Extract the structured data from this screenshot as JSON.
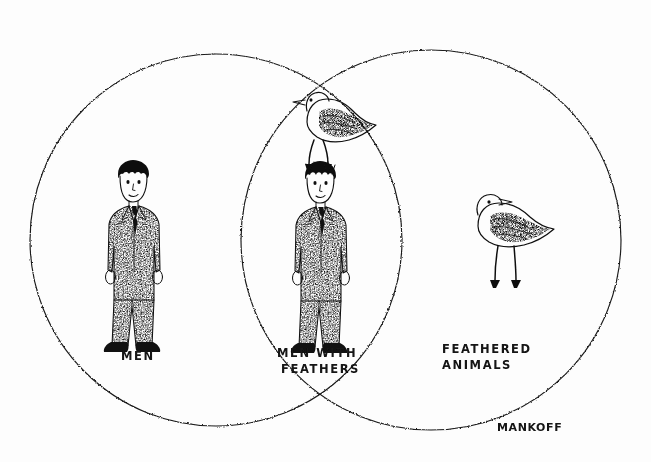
{
  "artwork": {
    "medium": "pen-and-ink cartoon",
    "type": "venn-diagram",
    "background_color": "#fdfdfd",
    "ink_color": "#111111",
    "width": 651,
    "height": 462
  },
  "diagram": {
    "kind": "two-set Venn diagram",
    "sets": [
      {
        "id": "men",
        "label": "MEN",
        "label_lines": [
          "MEN"
        ],
        "label_x": 148,
        "label_y": 358,
        "circle": {
          "cx": 216,
          "cy": 240,
          "r": 186
        }
      },
      {
        "id": "feathered-animals",
        "label": "FEATHERED ANIMALS",
        "label_lines": [
          "FEATHERED",
          "ANIMALS"
        ],
        "label_x": 442,
        "label_y": 355,
        "circle": {
          "cx": 431,
          "cy": 240,
          "r": 190
        }
      }
    ],
    "intersection": {
      "id": "men-with-feathers",
      "label": "MEN WITH FEATHERS",
      "label_lines": [
        "MEN WITH",
        "FEATHERS"
      ],
      "label_x": 282,
      "label_y": 358
    }
  },
  "figures": [
    {
      "id": "man-plain",
      "name": "man-in-suit",
      "region": "men",
      "description": "man in stippled suit and tie, arms at sides, dark shoes"
    },
    {
      "id": "man-with-bird",
      "name": "man-with-bird-on-head",
      "region": "men-with-feathers",
      "description": "man in stippled suit and tie with a shorebird perched on his head"
    },
    {
      "id": "bird-perched",
      "name": "bird-on-head",
      "region": "men-with-feathers",
      "description": "speckled shorebird standing on the man's head, facing right"
    },
    {
      "id": "bird-alone",
      "name": "shorebird",
      "region": "feathered-animals",
      "description": "speckled long-legged shorebird facing right"
    }
  ],
  "signature": {
    "text": "MANKOFF",
    "x": 497,
    "y": 430
  }
}
